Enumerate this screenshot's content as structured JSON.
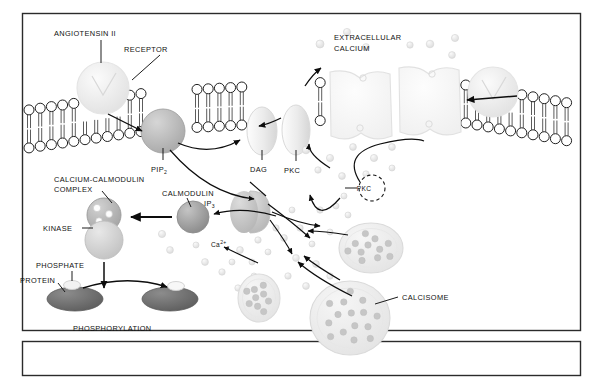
{
  "figure": {
    "title_visible": false,
    "domain": "biology-signal-transduction-diagram",
    "frame": {
      "border_color": "#2b2b2b",
      "background": "#ffffff"
    },
    "caption_box": {
      "present": true,
      "text": "",
      "border_color": "#2b2b2b"
    }
  },
  "labels": {
    "angiotensin": "ANGIOTENSIN II",
    "receptor": "RECEPTOR",
    "pip2_main": "PIP",
    "pip2_sub": "2",
    "dag": "DAG",
    "pkc_membrane": "PKC",
    "extracellular_calcium_line1": "EXTRACELLULAR",
    "extracellular_calcium_line2": "CALCIUM",
    "calcium_calmodulin_line1": "CALCIUM-CALMODULIN",
    "calcium_calmodulin_line2": "COMPLEX",
    "calmodulin": "CALMODULIN",
    "kinase": "KINASE",
    "ip3_main": "IP",
    "ip3_sub": "3",
    "phosphate": "PHOSPHATE",
    "protein": "PROTEIN",
    "phosphorylation": "PHOSPHORYLATION",
    "calcium_cytosolic_main": "Ca",
    "calcium_cytosolic_sup": "2+",
    "calcium_cytosolic_sub": "c",
    "pkc_cytosol": "PKC",
    "calcisome": "CALCISOME"
  },
  "colors": {
    "ink": "#111111",
    "frame": "#2b2b2b",
    "membrane_stroke": "#1a1a1a",
    "receptor_fill": "#ececec",
    "pip2_fill": "#b8b8b8",
    "dag_fill": "#e6e6e6",
    "pkc_fill": "#e2e2e2",
    "channel_fill": "#f7f7f7",
    "calmodulin_fill": "#9c9c9c",
    "kinase_fill": "#cfcfcf",
    "complex_fill": "#b2b2b2",
    "ip3_fill": "#c6c6c6",
    "calcisome_fill": "#ededed",
    "calcisome_dot": "#c2c2c2",
    "protein_fill": "#6e6e6e",
    "phosphate_fill": "#f0f0f0",
    "ion_fill": "#e3e3e3",
    "arrow": "#0d0d0d"
  },
  "elements": {
    "receptors": [
      {
        "name": "angiotensin-receptor-left",
        "cx": 103,
        "cy": 88,
        "r": 26
      },
      {
        "name": "receptor-right",
        "cx": 493,
        "cy": 92,
        "r": 25
      }
    ],
    "pip2": {
      "cx": 163,
      "cy": 131,
      "r": 22
    },
    "dag": {
      "cx": 262,
      "cy": 131,
      "rx": 15,
      "ry": 24
    },
    "pkc_membrane": {
      "cx": 296,
      "cy": 130,
      "rx": 14,
      "ry": 25
    },
    "ion_channels": [
      {
        "name": "calcium-channel-1",
        "cx": 350,
        "cy": 108
      },
      {
        "name": "calcium-channel-2",
        "cx": 420,
        "cy": 104
      }
    ],
    "calcium_calmodulin_complex": {
      "cx": 104,
      "cy": 215,
      "r": 17,
      "bound_ions": 3
    },
    "kinase": {
      "cx": 104,
      "cy": 240,
      "r": 19
    },
    "calmodulin": {
      "cx": 193,
      "cy": 217,
      "r": 16
    },
    "ip3": {
      "cx": 250,
      "cy": 212,
      "rx": 19,
      "ry": 21
    },
    "pkc_cytosol": {
      "cx": 372,
      "cy": 188,
      "r": 13,
      "style": "dashed"
    },
    "calcisomes": [
      {
        "name": "calcisome-small",
        "cx": 259,
        "cy": 298,
        "rx": 21,
        "ry": 24,
        "dots": 9
      },
      {
        "name": "calcisome-mid",
        "cx": 371,
        "cy": 248,
        "rx": 32,
        "ry": 25,
        "dots": 11
      },
      {
        "name": "calcisome-large",
        "cx": 350,
        "cy": 318,
        "rx": 40,
        "ry": 37,
        "dots": 15
      }
    ],
    "proteins": [
      {
        "name": "protein-unphosphorylated",
        "cx": 75,
        "cy": 299,
        "rx": 28,
        "ry": 12
      },
      {
        "name": "protein-phosphorylated",
        "cx": 170,
        "cy": 299,
        "rx": 28,
        "ry": 12
      }
    ],
    "phosphate_groups": [
      {
        "name": "phosphate-free",
        "cx": 72,
        "cy": 284
      },
      {
        "name": "phosphate-bound",
        "cx": 175,
        "cy": 285
      }
    ]
  },
  "arrows": [
    {
      "name": "arrow-receptor-to-pip2",
      "from": "angiotensin-receptor",
      "to": "pip2"
    },
    {
      "name": "arrow-pip2-to-dag",
      "from": "pip2",
      "to": "dag"
    },
    {
      "name": "arrow-pip2-to-ip3",
      "from": "pip2",
      "to": "ip3"
    },
    {
      "name": "arrow-pkc-cytosol-to-pkc-membrane",
      "from": "pkc-cytosol",
      "to": "pkc-membrane"
    },
    {
      "name": "arrow-calcium-to-pkc-cytosol",
      "from": "cytosolic-calcium",
      "to": "pkc-cytosol"
    },
    {
      "name": "arrow-calmodulin-to-complex",
      "from": "calmodulin",
      "to": "calcium-calmodulin-complex"
    },
    {
      "name": "arrow-calcium-to-calmodulin",
      "from": "cytosolic-calcium",
      "to": "calmodulin"
    },
    {
      "name": "arrow-kinase-to-phosphorylation",
      "from": "kinase",
      "to": "phosphorylation"
    },
    {
      "name": "arrow-protein-to-phosphoprotein",
      "from": "protein",
      "to": "phospho-protein"
    },
    {
      "name": "arrow-ip3-to-calcisomes",
      "from": "ip3",
      "to": "calcisomes"
    },
    {
      "name": "arrow-calcisome-release-1",
      "from": "calcisome-mid",
      "to": "cytosolic-calcium"
    },
    {
      "name": "arrow-calcisome-release-2",
      "from": "calcisome-large",
      "to": "cytosolic-calcium"
    },
    {
      "name": "arrow-extracellular-influx-left",
      "from": "extracellular-calcium",
      "to": "cytosol"
    },
    {
      "name": "arrow-extracellular-influx-right",
      "from": "receptor-right",
      "to": "membrane"
    }
  ]
}
